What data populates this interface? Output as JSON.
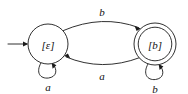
{
  "diagram": {
    "type": "finite-automaton-state-diagram",
    "background_color": "#ffffff",
    "stroke_color": "#1a1a1a",
    "label_color": "#111111",
    "start_state": "[ε]",
    "accepting_states": [
      "[b]"
    ],
    "alphabet": [
      "a",
      "b"
    ],
    "states": [
      {
        "id": "state-epsilon",
        "label": "[ε]",
        "bracket_open": "[",
        "bracket_close": "]",
        "symbol": "ε",
        "accepting": false,
        "is_start": true,
        "cx": 48,
        "cy": 44,
        "r": 20
      },
      {
        "id": "state-b",
        "label": "[b]",
        "bracket_open": "[",
        "bracket_close": "]",
        "symbol": "b",
        "accepting": true,
        "is_start": false,
        "cx": 155,
        "cy": 44,
        "r": 21,
        "r_inner": 17
      }
    ],
    "transitions": [
      {
        "id": "edge-eps-to-b",
        "from": "[ε]",
        "to": "[b]",
        "label": "b",
        "shape": "arc-top",
        "label_x": 102,
        "label_y": 12
      },
      {
        "id": "edge-b-to-eps",
        "from": "[b]",
        "to": "[ε]",
        "label": "a",
        "shape": "arc-bottom",
        "label_x": 102,
        "label_y": 76
      },
      {
        "id": "edge-eps-self",
        "from": "[ε]",
        "to": "[ε]",
        "label": "a",
        "shape": "self-loop-bottom",
        "label_x": 48,
        "label_y": 86
      },
      {
        "id": "edge-b-self",
        "from": "[b]",
        "to": "[b]",
        "label": "b",
        "shape": "self-loop-bottom",
        "label_x": 155,
        "label_y": 88
      }
    ],
    "start_arrow": {
      "id": "start-arrow",
      "x1": 8,
      "y1": 44,
      "x2": 28,
      "y2": 44
    }
  }
}
